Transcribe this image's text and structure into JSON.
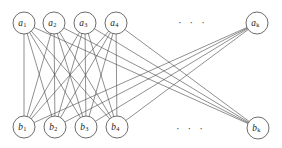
{
  "figure": {
    "background_color": "#ffffff",
    "edge_color": "#4a4a4a",
    "node_fill": "#ffffff",
    "node_stroke": "#535353",
    "label_color": "#1a1a1a",
    "width": 282,
    "height": 148
  },
  "ellipses": [
    {
      "name": "top-ellipsis",
      "text": "· · ·",
      "x": 178,
      "y": 17
    },
    {
      "name": "bottom-ellipsis",
      "text": "· · ·",
      "x": 176,
      "y": 123
    }
  ],
  "nodes": {
    "top_row": [
      {
        "id": "a1",
        "base": "a",
        "sub": "1",
        "cx": 24,
        "cy": 23,
        "r": 11
      },
      {
        "id": "a2",
        "base": "a",
        "sub": "2",
        "cx": 54,
        "cy": 23,
        "r": 11
      },
      {
        "id": "a3",
        "base": "a",
        "sub": "3",
        "cx": 85,
        "cy": 23,
        "r": 11
      },
      {
        "id": "a4",
        "base": "a",
        "sub": "4",
        "cx": 116,
        "cy": 23,
        "r": 11
      },
      {
        "id": "ak",
        "base": "a",
        "sub": "k",
        "cx": 257,
        "cy": 23,
        "r": 11
      }
    ],
    "bottom_row": [
      {
        "id": "b1",
        "base": "b",
        "sub": "1",
        "cx": 24,
        "cy": 127,
        "r": 11
      },
      {
        "id": "b2",
        "base": "b",
        "sub": "2",
        "cx": 55,
        "cy": 127,
        "r": 11
      },
      {
        "id": "b3",
        "base": "b",
        "sub": "3",
        "cx": 86,
        "cy": 127,
        "r": 11
      },
      {
        "id": "b4",
        "base": "b",
        "sub": "4",
        "cx": 117,
        "cy": 127,
        "r": 11
      },
      {
        "id": "bk",
        "base": "b",
        "sub": "k",
        "cx": 258,
        "cy": 128,
        "r": 11
      }
    ]
  },
  "edges": [
    {
      "from": "a1",
      "to": "b1"
    },
    {
      "from": "a1",
      "to": "b2"
    },
    {
      "from": "a1",
      "to": "b3"
    },
    {
      "from": "a1",
      "to": "b4"
    },
    {
      "from": "a1",
      "to": "bk"
    },
    {
      "from": "a2",
      "to": "b1"
    },
    {
      "from": "a2",
      "to": "b2"
    },
    {
      "from": "a2",
      "to": "b3"
    },
    {
      "from": "a2",
      "to": "b4"
    },
    {
      "from": "a2",
      "to": "bk"
    },
    {
      "from": "a3",
      "to": "b1"
    },
    {
      "from": "a3",
      "to": "b2"
    },
    {
      "from": "a3",
      "to": "b3"
    },
    {
      "from": "a3",
      "to": "b4"
    },
    {
      "from": "a3",
      "to": "bk"
    },
    {
      "from": "a4",
      "to": "b1"
    },
    {
      "from": "a4",
      "to": "b2"
    },
    {
      "from": "a4",
      "to": "b3"
    },
    {
      "from": "a4",
      "to": "b4"
    },
    {
      "from": "a4",
      "to": "bk"
    },
    {
      "from": "ak",
      "to": "b1"
    },
    {
      "from": "ak",
      "to": "b2"
    },
    {
      "from": "ak",
      "to": "b3"
    },
    {
      "from": "ak",
      "to": "b4"
    }
  ]
}
